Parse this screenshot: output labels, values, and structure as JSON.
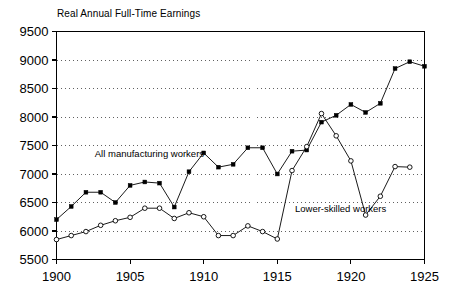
{
  "chart_data": {
    "type": "line",
    "title": "Real Annual Full-Time Earnings",
    "xlabel": "",
    "ylabel": "",
    "xlim": [
      1900,
      1925
    ],
    "ylim": [
      5500,
      9500
    ],
    "ytick_step": 500,
    "xtick_step": 5,
    "grid": "horizontal-dotted",
    "legend_position": "inline-annotations",
    "yticks": [
      "5500",
      "6000",
      "6500",
      "7000",
      "7500",
      "8000",
      "8500",
      "9000",
      "9500"
    ],
    "xticks": [
      "1900",
      "1905",
      "1910",
      "1915",
      "1920",
      "1925"
    ],
    "series": [
      {
        "name": "All manufacturing workers",
        "marker": "filled-square",
        "color": "#000000",
        "x": [
          1900,
          1901,
          1902,
          1903,
          1904,
          1905,
          1906,
          1907,
          1908,
          1909,
          1910,
          1911,
          1912,
          1913,
          1914,
          1915,
          1916,
          1917,
          1918,
          1919,
          1920,
          1921,
          1922,
          1923,
          1924,
          1925
        ],
        "values": [
          6200,
          6430,
          6680,
          6680,
          6500,
          6800,
          6860,
          6840,
          6420,
          7040,
          7370,
          7120,
          7170,
          7460,
          7460,
          7000,
          7400,
          7420,
          7910,
          8030,
          8220,
          8080,
          8240,
          8850,
          8970,
          8890
        ]
      },
      {
        "name": "Lower-skilled workers",
        "marker": "open-circle",
        "color": "#000000",
        "x": [
          1900,
          1901,
          1902,
          1903,
          1904,
          1905,
          1906,
          1907,
          1908,
          1909,
          1910,
          1911,
          1912,
          1913,
          1914,
          1915,
          1916,
          1917,
          1918,
          1919,
          1920,
          1921,
          1922,
          1923,
          1924
        ],
        "values": [
          5850,
          5920,
          5990,
          6100,
          6180,
          6240,
          6400,
          6400,
          6220,
          6320,
          6250,
          5920,
          5920,
          6090,
          5990,
          5860,
          7060,
          7480,
          8060,
          7670,
          7230,
          6280,
          6610,
          7130,
          7120
        ]
      }
    ],
    "annotations": [
      {
        "text": "All manufacturing workers",
        "x": 1902.6,
        "y": 7300
      },
      {
        "text": "Lower-skilled workers",
        "x": 1916.2,
        "y": 6330
      }
    ]
  }
}
